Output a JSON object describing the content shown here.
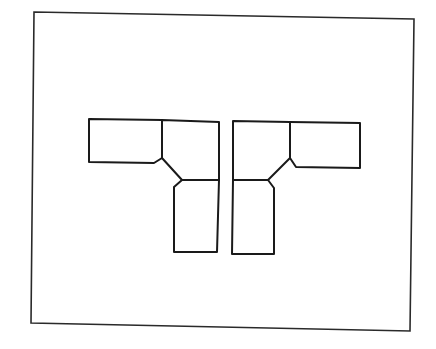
{
  "diagram": {
    "colors": {
      "background": "#ffffff",
      "line": "#1a1a1a",
      "frame": "#2a2a2a"
    },
    "frame": {
      "points": "34,12 414,19 410,331 31,323"
    },
    "left_piece": {
      "name": "left-corner-sectional",
      "segments": [
        {
          "name": "arm-top-left",
          "points": "162,120 89,119 89,162 154,163 162,158"
        },
        {
          "name": "corner-block",
          "points": "162,120 219,122 219,180 182,180 162,158 162,120"
        },
        {
          "name": "arm-bottom",
          "points": "219,180 217,252 174,252 174,187 182,180"
        }
      ]
    },
    "right_piece": {
      "name": "right-corner-sectional",
      "segments": [
        {
          "name": "arm-top-right",
          "points": "290,122 360,123 360,168 296,167 290,158"
        },
        {
          "name": "corner-block",
          "points": "290,122 233,121 233,180 268,180 290,158 290,122"
        },
        {
          "name": "arm-bottom",
          "points": "233,180 232,254 274,254 274,188 268,180"
        }
      ]
    }
  }
}
